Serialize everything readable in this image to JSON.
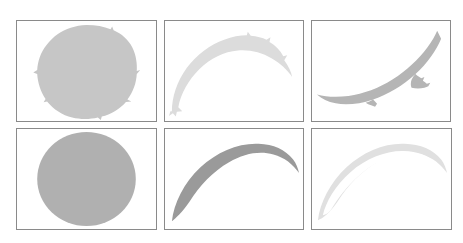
{
  "figure": {
    "type": "image-grid",
    "background_color": "#ffffff",
    "canvas": {
      "width": 463,
      "height": 243
    },
    "grid": {
      "rows": 2,
      "columns": 3,
      "panel_border_color": "#8a8a8a",
      "panel_border_width": 1
    }
  },
  "panels": [
    {
      "id": "panel-1",
      "position": {
        "row": 1,
        "column": 1
      },
      "x": 16,
      "y": 20,
      "width": 141,
      "height": 102,
      "shape": "full-disc",
      "shape_label": "full disc",
      "edge": "ragged",
      "fill_color": "#c6c6c6",
      "geometry": {
        "cx": 0.5,
        "cy": 0.5,
        "rx": 0.345,
        "ry": 0.475,
        "arc_sweep": 0,
        "taper": 0
      }
    },
    {
      "id": "panel-2",
      "position": {
        "row": 1,
        "column": 2
      },
      "x": 164,
      "y": 20,
      "width": 140,
      "height": 102,
      "shape": "thick-arc-upward",
      "shape_label": "thick upward crescent",
      "edge": "ragged",
      "fill_color": "#dcdcdc",
      "geometry": {
        "start_x": 0.06,
        "start_y": 0.88,
        "apex_x": 0.56,
        "apex_y": 0.26,
        "end_x": 0.96,
        "end_y": 0.47,
        "thickness": 0.22
      }
    },
    {
      "id": "panel-3",
      "position": {
        "row": 1,
        "column": 3
      },
      "x": 311,
      "y": 20,
      "width": 140,
      "height": 102,
      "shape": "thick-arc-downward",
      "shape_label": "thick downward crescent",
      "edge": "ragged",
      "fill_color": "#b5b5b5",
      "geometry": {
        "start_x": 0.04,
        "start_y": 0.62,
        "apex_x": 0.52,
        "apex_y": 0.86,
        "end_x": 0.96,
        "end_y": 0.18,
        "thickness": 0.2
      }
    },
    {
      "id": "panel-4",
      "position": {
        "row": 2,
        "column": 1
      },
      "x": 16,
      "y": 128,
      "width": 141,
      "height": 102,
      "shape": "full-disc",
      "shape_label": "full disc",
      "edge": "smooth",
      "fill_color": "#b0b0b0",
      "geometry": {
        "cx": 0.5,
        "cy": 0.5,
        "rx": 0.355,
        "ry": 0.47,
        "arc_sweep": 0,
        "taper": 0
      }
    },
    {
      "id": "panel-5",
      "position": {
        "row": 2,
        "column": 2
      },
      "x": 164,
      "y": 128,
      "width": 140,
      "height": 102,
      "shape": "tapered-arc-upward",
      "shape_label": "tapered upward crescent",
      "edge": "smooth",
      "fill_color": "#9a9a9a",
      "geometry": {
        "start_x": 0.05,
        "start_y": 0.92,
        "apex_x": 0.52,
        "apex_y": 0.16,
        "end_x": 0.95,
        "end_y": 0.52,
        "thickness": 0.16
      }
    },
    {
      "id": "panel-6",
      "position": {
        "row": 2,
        "column": 3
      },
      "x": 311,
      "y": 128,
      "width": 141,
      "height": 102,
      "shape": "thin-tapered-arc-upward",
      "shape_label": "thin tapered upward crescent",
      "edge": "smooth",
      "fill_color": "#e0e0e0",
      "geometry": {
        "start_x": 0.04,
        "start_y": 0.9,
        "apex_x": 0.5,
        "apex_y": 0.18,
        "end_x": 0.96,
        "end_y": 0.5,
        "thickness": 0.07
      }
    }
  ],
  "colors": {
    "background": "#ffffff",
    "border": "#8a8a8a"
  }
}
